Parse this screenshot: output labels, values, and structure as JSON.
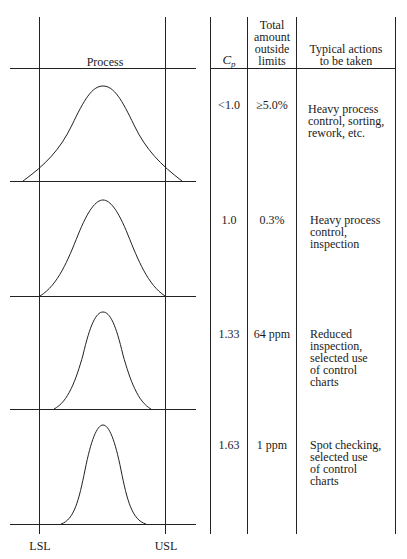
{
  "headers": {
    "process": "Process",
    "cp_main": "C",
    "cp_sub": "p",
    "total_outside": [
      "Total",
      "amount",
      "outside",
      "limits"
    ],
    "actions": [
      "Typical actions",
      "to be taken"
    ]
  },
  "rows": [
    {
      "cp": "<1.0",
      "outside": "≥5.0%",
      "actions": [
        "Heavy process",
        "control, sorting,",
        "rework, etc."
      ]
    },
    {
      "cp": "1.0",
      "outside": "0.3%",
      "actions": [
        "Heavy process",
        "control,",
        "inspection"
      ]
    },
    {
      "cp": "1.33",
      "outside": "64 ppm",
      "actions": [
        "Reduced",
        "inspection,",
        "selected use",
        "of control",
        "charts"
      ]
    },
    {
      "cp": "1.63",
      "outside": "1 ppm",
      "actions": [
        "Spot checking,",
        "selected use",
        "of control",
        "charts"
      ]
    }
  ],
  "limits": {
    "lower": "LSL",
    "upper": "USL"
  },
  "colors": {
    "ink": "#1a1a1a",
    "background": "#ffffff"
  }
}
